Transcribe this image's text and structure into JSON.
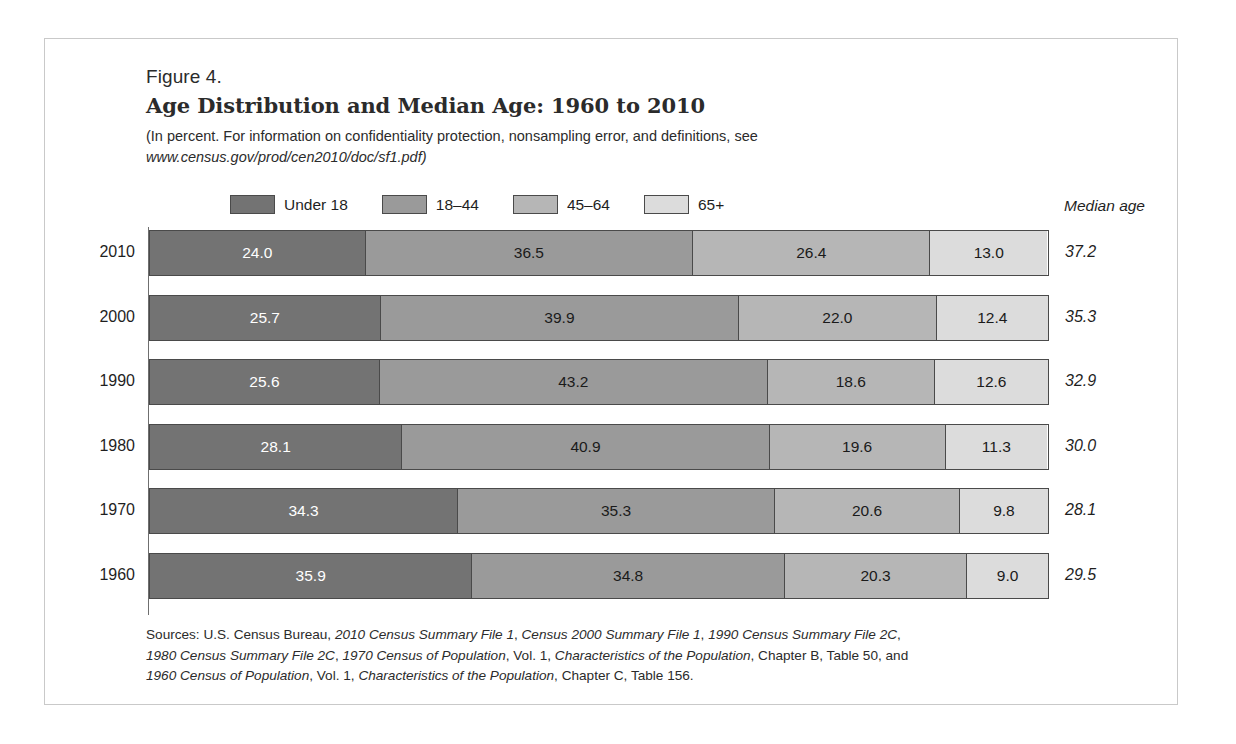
{
  "figure": {
    "number": "Figure 4.",
    "title": "Age Distribution and Median Age: 1960 to 2010",
    "subtitle_line1": "(In percent. For information on confidentiality protection, nonsampling error, and definitions, see",
    "subtitle_url": "www.census.gov/prod/cen2010/doc/sf1.pdf)"
  },
  "legend": {
    "items": [
      {
        "label": "Under 18",
        "color": "#737373"
      },
      {
        "label": "18–44",
        "color": "#9a9a9a"
      },
      {
        "label": "45–64",
        "color": "#b6b6b6"
      },
      {
        "label": "65+",
        "color": "#dcdcdc"
      }
    ]
  },
  "median_age_header": "Median age",
  "chart_data": {
    "type": "bar",
    "orientation": "horizontal",
    "stacked": true,
    "title": "Age Distribution and Median Age: 1960 to 2010",
    "subtitle": "(In percent. For information on confidentiality protection, nonsampling error, and definitions, see www.census.gov/prod/cen2010/doc/sf1.pdf)",
    "xlabel": "",
    "ylabel": "",
    "xlim": [
      0,
      100
    ],
    "grid": false,
    "legend_position": "top",
    "categories": [
      "2010",
      "2000",
      "1990",
      "1980",
      "1970",
      "1960"
    ],
    "series": [
      {
        "name": "Under 18",
        "color": "#737373",
        "values": [
          24.0,
          25.7,
          25.6,
          28.1,
          34.3,
          35.9
        ]
      },
      {
        "name": "18–44",
        "color": "#9a9a9a",
        "values": [
          36.5,
          39.9,
          43.2,
          40.9,
          35.3,
          34.8
        ]
      },
      {
        "name": "45–64",
        "color": "#b6b6b6",
        "values": [
          26.4,
          22.0,
          18.6,
          19.6,
          20.6,
          20.3
        ]
      },
      {
        "name": "65+",
        "color": "#dcdcdc",
        "values": [
          13.0,
          12.4,
          12.6,
          11.3,
          9.8,
          9.0
        ]
      }
    ],
    "annotations": {
      "median_age_label": "Median age",
      "median_age": [
        37.2,
        35.3,
        32.9,
        30.0,
        28.1,
        29.5
      ]
    }
  },
  "rows": [
    {
      "year": "2010",
      "median": "37.2",
      "segments": [
        {
          "label": "24.0",
          "value": 24.0,
          "color": "#737373",
          "light_text": true
        },
        {
          "label": "36.5",
          "value": 36.5,
          "color": "#9a9a9a",
          "light_text": false
        },
        {
          "label": "26.4",
          "value": 26.4,
          "color": "#b6b6b6",
          "light_text": false
        },
        {
          "label": "13.0",
          "value": 13.0,
          "color": "#dcdcdc",
          "light_text": false
        }
      ]
    },
    {
      "year": "2000",
      "median": "35.3",
      "segments": [
        {
          "label": "25.7",
          "value": 25.7,
          "color": "#737373",
          "light_text": true
        },
        {
          "label": "39.9",
          "value": 39.9,
          "color": "#9a9a9a",
          "light_text": false
        },
        {
          "label": "22.0",
          "value": 22.0,
          "color": "#b6b6b6",
          "light_text": false
        },
        {
          "label": "12.4",
          "value": 12.4,
          "color": "#dcdcdc",
          "light_text": false
        }
      ]
    },
    {
      "year": "1990",
      "median": "32.9",
      "segments": [
        {
          "label": "25.6",
          "value": 25.6,
          "color": "#737373",
          "light_text": true
        },
        {
          "label": "43.2",
          "value": 43.2,
          "color": "#9a9a9a",
          "light_text": false
        },
        {
          "label": "18.6",
          "value": 18.6,
          "color": "#b6b6b6",
          "light_text": false
        },
        {
          "label": "12.6",
          "value": 12.6,
          "color": "#dcdcdc",
          "light_text": false
        }
      ]
    },
    {
      "year": "1980",
      "median": "30.0",
      "segments": [
        {
          "label": "28.1",
          "value": 28.1,
          "color": "#737373",
          "light_text": true
        },
        {
          "label": "40.9",
          "value": 40.9,
          "color": "#9a9a9a",
          "light_text": false
        },
        {
          "label": "19.6",
          "value": 19.6,
          "color": "#b6b6b6",
          "light_text": false
        },
        {
          "label": "11.3",
          "value": 11.3,
          "color": "#dcdcdc",
          "light_text": false
        }
      ]
    },
    {
      "year": "1970",
      "median": "28.1",
      "segments": [
        {
          "label": "34.3",
          "value": 34.3,
          "color": "#737373",
          "light_text": true
        },
        {
          "label": "35.3",
          "value": 35.3,
          "color": "#9a9a9a",
          "light_text": false
        },
        {
          "label": "20.6",
          "value": 20.6,
          "color": "#b6b6b6",
          "light_text": false
        },
        {
          "label": "9.8",
          "value": 9.8,
          "color": "#dcdcdc",
          "light_text": false
        }
      ]
    },
    {
      "year": "1960",
      "median": "29.5",
      "segments": [
        {
          "label": "35.9",
          "value": 35.9,
          "color": "#737373",
          "light_text": true
        },
        {
          "label": "34.8",
          "value": 34.8,
          "color": "#9a9a9a",
          "light_text": false
        },
        {
          "label": "20.3",
          "value": 20.3,
          "color": "#b6b6b6",
          "light_text": false
        },
        {
          "label": "9.0",
          "value": 9.0,
          "color": "#dcdcdc",
          "light_text": false
        }
      ]
    }
  ],
  "sources": {
    "line1_prefix": "Sources: U.S. Census Bureau, ",
    "line1_i1": "2010 Census Summary File 1",
    "line1_sep1": ", ",
    "line1_i2": "Census 2000 Summary File 1",
    "line1_sep2": ", ",
    "line1_i3": "1990 Census Summary File 2C",
    "line1_suffix": ",",
    "line2_i1": "1980 Census Summary File 2C",
    "line2_sep1": ", ",
    "line2_i2": "1970 Census of Population",
    "line2_mid": ", Vol. 1, ",
    "line2_i3": "Characteristics of the Population",
    "line2_suffix": ", Chapter B, Table 50, and",
    "line3_i1": "1960 Census of Population",
    "line3_mid": ", Vol. 1, ",
    "line3_i2": "Characteristics of the Population",
    "line3_suffix": ", Chapter C, Table 156."
  }
}
